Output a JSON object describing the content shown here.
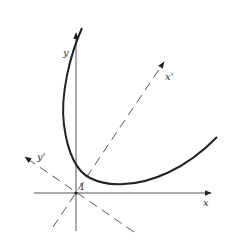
{
  "diagram": {
    "type": "rotated-parabola-axes",
    "labels": {
      "x_axis": "x",
      "y_axis": "y",
      "x_prime_axis": "x'",
      "y_prime_axis": "y'",
      "unit_mark": "1"
    },
    "colors": {
      "ink": "#222222",
      "axis": "#555555",
      "background": "#ffffff"
    }
  }
}
